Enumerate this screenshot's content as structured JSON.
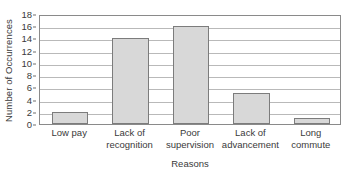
{
  "chart_data": {
    "type": "bar",
    "title": "",
    "subtitle": "",
    "xlabel": "Reasons",
    "ylabel": "Number of Occurrences",
    "categories": [
      "Low pay",
      "Lack of recognition",
      "Poor supervision",
      "Lack of advancement",
      "Long commute"
    ],
    "category_lines": [
      [
        "Low pay"
      ],
      [
        "Lack of",
        "recognition"
      ],
      [
        "Poor",
        "supervision"
      ],
      [
        "Lack of",
        "advancement"
      ],
      [
        "Long",
        "commute"
      ]
    ],
    "values": [
      2,
      14,
      16,
      5,
      1
    ],
    "ylim": [
      0,
      18
    ],
    "ytick_interval": 2,
    "yticks": [
      0,
      2,
      4,
      6,
      8,
      10,
      12,
      14,
      16,
      18
    ],
    "ytick_labels": [
      "0",
      "2",
      "4",
      "6",
      "8",
      "10",
      "12",
      "14",
      "16",
      "18"
    ],
    "grid": "horizontal",
    "legend": "none",
    "orientation": "vertical",
    "colors": {
      "bar_fill": "#d8d8d8",
      "bar_edge": "#7c7c7c",
      "gridline": "#b9b9b9",
      "frame": "#8a8a8a",
      "text": "#3a3a3a",
      "background": "#ffffff"
    }
  }
}
